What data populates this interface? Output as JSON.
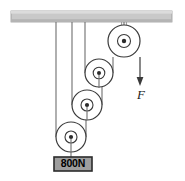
{
  "figure": {
    "type": "physics-pulley-diagram",
    "background_color": "#ffffff",
    "stroke_color": "#3a3a3a",
    "rope_color": "#6e6e6e"
  },
  "ceiling": {
    "name": "ceiling-support-bar",
    "fill_color": "#c9c9c9",
    "edge_color": "#8f8f8f",
    "x": 11,
    "y": 11,
    "width": 161,
    "height": 11
  },
  "pulleys": [
    {
      "id": "pulley-top-right",
      "cx": 124,
      "cy": 41,
      "r_outer": 16,
      "r_inner": 6.5,
      "r_hub": 2.2,
      "fixed": true,
      "hanger_top_y": 22
    },
    {
      "id": "pulley-upper-movable",
      "cx": 99,
      "cy": 73,
      "r_outer": 14,
      "r_inner": 5.8,
      "r_hub": 2.0,
      "fixed": false
    },
    {
      "id": "pulley-middle-movable",
      "cx": 87,
      "cy": 105,
      "r_outer": 15,
      "r_inner": 6.0,
      "r_hub": 2.1,
      "fixed": false
    },
    {
      "id": "pulley-lower-movable",
      "cx": 71,
      "cy": 137,
      "r_outer": 15,
      "r_inner": 6.0,
      "r_hub": 2.1,
      "fixed": false
    }
  ],
  "ropes": [
    {
      "id": "rope-anchor-left",
      "x": 56,
      "y_top": 22,
      "y_bottom": 137
    },
    {
      "id": "rope-anchor-middle",
      "x": 72,
      "y_top": 22,
      "y_bottom": 105
    },
    {
      "id": "rope-anchor-right",
      "x": 85,
      "y_top": 22,
      "y_bottom": 73
    }
  ],
  "force": {
    "name": "applied-force-F",
    "label": "F",
    "arrow_x": 140,
    "arrow_y_top": 57,
    "arrow_y_bottom": 84,
    "label_x": 141,
    "label_y": 98,
    "direction": "down"
  },
  "load": {
    "name": "hanging-load",
    "label": "800N",
    "fill_color": "#9e9e9e",
    "border_color": "#2b2b2b",
    "x": 54,
    "y": 157,
    "width": 38,
    "height": 14,
    "text_x": 73,
    "text_y": 167
  }
}
